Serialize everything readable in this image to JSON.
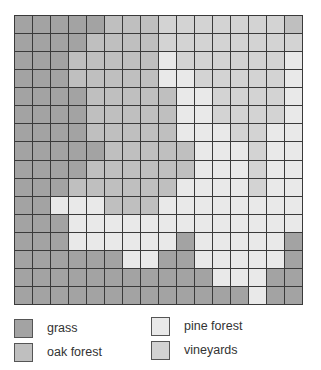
{
  "colors": {
    "G": "#a3a3a3",
    "O": "#bfbfbf",
    "V": "#d3d3d3",
    "P": "#e9e9e9"
  },
  "legend": [
    {
      "key": "G",
      "label": "grass",
      "color": "#a3a3a3"
    },
    {
      "key": "O",
      "label": "oak forest",
      "color": "#bfbfbf"
    },
    {
      "key": "P",
      "label": "pine forest",
      "color": "#e9e9e9"
    },
    {
      "key": "V",
      "label": "vineyards",
      "color": "#d3d3d3"
    }
  ],
  "grid": {
    "rows": 16,
    "cols": 16,
    "cells": [
      "GGGGGOOOVVVVVVVO",
      "GGGGOOOOVVVVVVVV",
      "GGGOOOOOPVVVVVVP",
      "GGGOOOOOPPVVVVVP",
      "GGGGOOOOOPPVVVVP",
      "GGGGOOOOOPPVVVVP",
      "GGGGOOOOOPPPVVPP",
      "GGGGGOOOOOPPPVPP",
      "GGGGOOOOOOPPPVPP",
      "GGGOOOOOOPPPPVPP",
      "GGPPPOOOPPPPPPPP",
      "GGGPPPPPPPPPPPPP",
      "GGGPPPPPPGPPPPPG",
      "GGGGGGPPGGPPPPPG",
      "GGGGGGGGGGGPPPGG",
      "GGGGGGGGGGGGGPGG"
    ]
  }
}
